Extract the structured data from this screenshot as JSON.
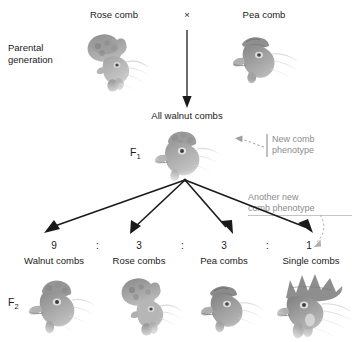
{
  "diagram": {
    "title_rows": {
      "parental_generation_label": "Parental\ngeneration",
      "f1_label": "F",
      "f1_sub": "1",
      "f2_label": "F",
      "f2_sub": "2"
    },
    "parental": {
      "left_label": "Rose comb",
      "cross_symbol": "×",
      "right_label": "Pea comb"
    },
    "f1": {
      "label": "All walnut combs"
    },
    "annotations": {
      "new_phenotype": "New comb\nphenotype",
      "new_phenotype_line1": "New comb",
      "new_phenotype_line2": "phenotype",
      "another_new_phenotype_line1": "Another new",
      "another_new_phenotype_line2": "comb phenotype"
    },
    "f2": {
      "columns": [
        {
          "ratio": "9",
          "label": "Walnut combs",
          "comb_type": "walnut"
        },
        {
          "ratio": "3",
          "label": "Rose combs",
          "comb_type": "rose"
        },
        {
          "ratio": "3",
          "label": "Pea combs",
          "comb_type": "pea"
        },
        {
          "ratio": "1",
          "label": "Single combs",
          "comb_type": "single"
        }
      ],
      "separators": [
        ":",
        ":",
        ":"
      ],
      "ratio_text": "9 : 3 : 3 : 1"
    },
    "colors": {
      "text": "#1a1a1a",
      "annotation": "#8c8c8c",
      "arrow": "#1a1a1a",
      "leader": "#a8a8a8",
      "background": "#ffffff"
    }
  }
}
